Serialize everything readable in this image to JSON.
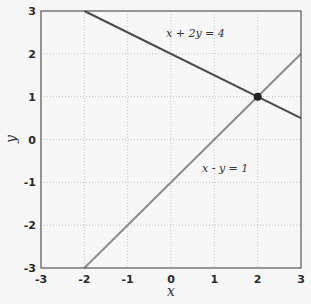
{
  "chart_data": {
    "type": "line",
    "title": "",
    "xlabel": "x",
    "ylabel": "y",
    "xlim": [
      -3,
      3
    ],
    "ylim": [
      -3,
      3
    ],
    "xticks": [
      -3,
      -2,
      -1,
      0,
      1,
      2,
      3
    ],
    "yticks": [
      -3,
      -2,
      -1,
      0,
      1,
      2,
      3
    ],
    "grid": true,
    "series": [
      {
        "name": "x + 2y = 4",
        "equation": "y = (4 - x) / 2",
        "x": [
          -2,
          3
        ],
        "y": [
          3,
          0.5
        ],
        "color": "#4a4a4a"
      },
      {
        "name": "x - y = 1",
        "equation": "y = x - 1",
        "x": [
          -2,
          3
        ],
        "y": [
          -3,
          2
        ],
        "color": "#8c8c8c"
      }
    ],
    "points": [
      {
        "name": "intersection",
        "x": 2,
        "y": 1,
        "color": "#222222"
      }
    ],
    "annotations": [
      {
        "text": "x + 2y = 4",
        "x": 0.4,
        "y": 2.45
      },
      {
        "text": "x - y = 1",
        "x": 0.95,
        "y": -0.25
      }
    ]
  },
  "labels": {
    "xlabel": "x",
    "ylabel": "y",
    "line1": "x + 2y = 4",
    "line2": "x - y = 1"
  }
}
